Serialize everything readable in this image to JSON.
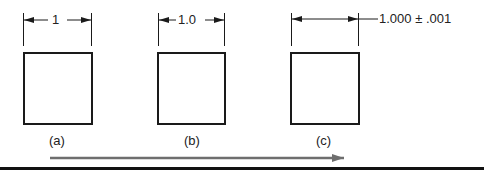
{
  "diagram": {
    "panels": [
      {
        "id": "a",
        "dimension": "1",
        "caption": "(a)"
      },
      {
        "id": "b",
        "dimension": "1.0",
        "caption": "(b)"
      },
      {
        "id": "c",
        "dimension": "1.000 ± .001",
        "caption": "(c)"
      }
    ],
    "progress_arrow": {
      "direction": "right",
      "color": "#6e6e6e"
    },
    "colors": {
      "lines": "#1a1a1a",
      "arrow": "#6e6e6e",
      "bottom_rule": "#111111"
    }
  }
}
